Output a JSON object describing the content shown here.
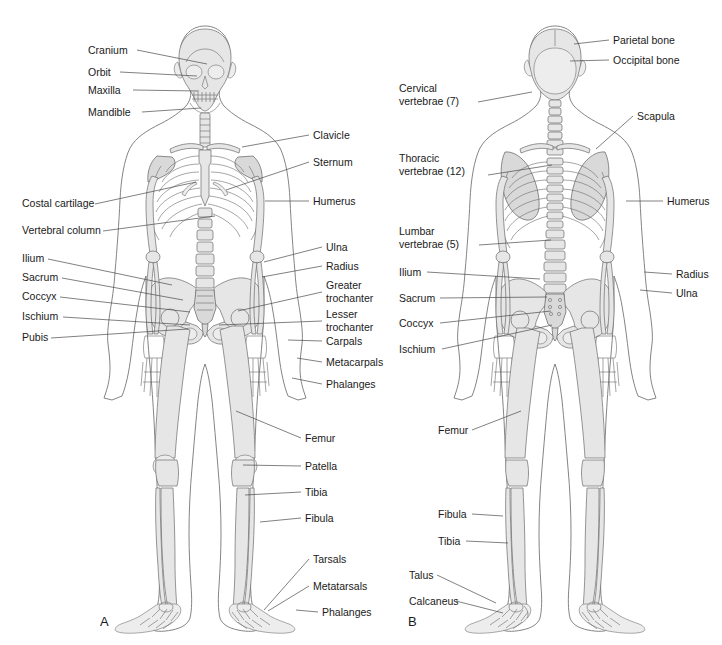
{
  "figure": {
    "background_color": "#ffffff",
    "bone_fill_color": "#e6e6e6",
    "bone_outline_color": "#6a6a6a",
    "body_outline_color": "#6e6e6e",
    "leader_line_color": "#4a4a4a",
    "text_color": "#1a1a1a"
  },
  "panels": [
    {
      "id": "panel-a",
      "letter": "A",
      "view": "anterior",
      "letter_position": {
        "x": 100,
        "y": 626
      }
    },
    {
      "id": "panel-b",
      "letter": "B",
      "view": "posterior",
      "letter_position": {
        "x": 408,
        "y": 626
      }
    }
  ],
  "panel_a_labels": [
    {
      "id": "cranium",
      "text": "Cranium",
      "lines": [
        "Cranium"
      ],
      "side": "left",
      "text_x": 88,
      "text_y": 54,
      "anchor": "start",
      "leader": [
        [
          137,
          50
        ],
        [
          207,
          64
        ]
      ]
    },
    {
      "id": "orbit",
      "text": "Orbit",
      "lines": [
        "Orbit"
      ],
      "side": "left",
      "text_x": 88,
      "text_y": 76,
      "anchor": "start",
      "leader": [
        [
          120,
          72
        ],
        [
          197,
          76
        ]
      ]
    },
    {
      "id": "maxilla",
      "text": "Maxilla",
      "lines": [
        "Maxilla"
      ],
      "side": "left",
      "text_x": 88,
      "text_y": 94,
      "anchor": "start",
      "leader": [
        [
          133,
          90
        ],
        [
          199,
          91
        ]
      ]
    },
    {
      "id": "mandible",
      "text": "Mandible",
      "lines": [
        "Mandible"
      ],
      "side": "left",
      "text_x": 88,
      "text_y": 116,
      "anchor": "start",
      "leader": [
        [
          142,
          112
        ],
        [
          201,
          108
        ]
      ]
    },
    {
      "id": "costal-cartilage",
      "text": "Costal cartilage",
      "lines": [
        "Costal cartilage"
      ],
      "side": "left",
      "text_x": 22,
      "text_y": 207,
      "anchor": "start",
      "leader": [
        [
          95,
          204
        ],
        [
          196,
          182
        ]
      ]
    },
    {
      "id": "vertebral-column",
      "text": "Vertebral column",
      "lines": [
        "Vertebral column"
      ],
      "side": "left",
      "text_x": 22,
      "text_y": 234,
      "anchor": "start",
      "leader": [
        [
          103,
          231
        ],
        [
          215,
          216
        ]
      ]
    },
    {
      "id": "ilium",
      "text": "Ilium",
      "lines": [
        "Ilium"
      ],
      "side": "left",
      "text_x": 22,
      "text_y": 262,
      "anchor": "start",
      "leader": [
        [
          48,
          259
        ],
        [
          172,
          285
        ]
      ]
    },
    {
      "id": "sacrum",
      "text": "Sacrum",
      "lines": [
        "Sacrum"
      ],
      "side": "left",
      "text_x": 22,
      "text_y": 281,
      "anchor": "start",
      "leader": [
        [
          62,
          278
        ],
        [
          183,
          300
        ]
      ]
    },
    {
      "id": "coccyx",
      "text": "Coccyx",
      "lines": [
        "Coccyx"
      ],
      "side": "left",
      "text_x": 22,
      "text_y": 300,
      "anchor": "start",
      "leader": [
        [
          60,
          297
        ],
        [
          190,
          312
        ]
      ]
    },
    {
      "id": "ischium",
      "text": "Ischium",
      "lines": [
        "Ischium"
      ],
      "side": "left",
      "text_x": 22,
      "text_y": 320,
      "anchor": "start",
      "leader": [
        [
          63,
          317
        ],
        [
          190,
          325
        ]
      ]
    },
    {
      "id": "pubis",
      "text": "Pubis",
      "lines": [
        "Pubis"
      ],
      "side": "left",
      "text_x": 22,
      "text_y": 341,
      "anchor": "start",
      "leader": [
        [
          51,
          338
        ],
        [
          188,
          329
        ]
      ]
    },
    {
      "id": "clavicle",
      "text": "Clavicle",
      "lines": [
        "Clavicle"
      ],
      "side": "right",
      "text_x": 313,
      "text_y": 139,
      "anchor": "start",
      "leader": [
        [
          309,
          135
        ],
        [
          242,
          147
        ]
      ]
    },
    {
      "id": "sternum",
      "text": "Sternum",
      "lines": [
        "Sternum"
      ],
      "side": "right",
      "text_x": 313,
      "text_y": 166,
      "anchor": "start",
      "leader": [
        [
          309,
          162
        ],
        [
          226,
          190
        ]
      ]
    },
    {
      "id": "humerus",
      "text": "Humerus",
      "lines": [
        "Humerus"
      ],
      "side": "right",
      "text_x": 313,
      "text_y": 205,
      "anchor": "start",
      "leader": [
        [
          309,
          201
        ],
        [
          265,
          201
        ]
      ]
    },
    {
      "id": "ulna",
      "text": "Ulna",
      "lines": [
        "Ulna"
      ],
      "side": "right",
      "text_x": 326,
      "text_y": 251,
      "anchor": "start",
      "leader": [
        [
          322,
          247
        ],
        [
          264,
          262
        ]
      ]
    },
    {
      "id": "radius",
      "text": "Radius",
      "lines": [
        "Radius"
      ],
      "side": "right",
      "text_x": 326,
      "text_y": 270,
      "anchor": "start",
      "leader": [
        [
          322,
          266
        ],
        [
          262,
          277
        ]
      ]
    },
    {
      "id": "greater-trochanter",
      "text": "Greater trochanter",
      "lines": [
        "Greater",
        "trochanter"
      ],
      "side": "right",
      "text_x": 326,
      "text_y": 289,
      "anchor": "start",
      "leader": [
        [
          322,
          292
        ],
        [
          238,
          311
        ]
      ]
    },
    {
      "id": "lesser-trochanter",
      "text": "Lesser trochanter",
      "lines": [
        "Lesser",
        "trochanter"
      ],
      "side": "right",
      "text_x": 326,
      "text_y": 318,
      "anchor": "start",
      "leader": [
        [
          322,
          321
        ],
        [
          219,
          325
        ]
      ]
    },
    {
      "id": "carpals",
      "text": "Carpals",
      "lines": [
        "Carpals"
      ],
      "side": "right",
      "text_x": 326,
      "text_y": 345,
      "anchor": "start",
      "leader": [
        [
          322,
          341
        ],
        [
          288,
          340
        ]
      ]
    },
    {
      "id": "metacarpals",
      "text": "Metacarpals",
      "lines": [
        "Metacarpals"
      ],
      "side": "right",
      "text_x": 326,
      "text_y": 366,
      "anchor": "start",
      "leader": [
        [
          322,
          362
        ],
        [
          297,
          358
        ]
      ]
    },
    {
      "id": "phalanges-hand",
      "text": "Phalanges",
      "lines": [
        "Phalanges"
      ],
      "side": "right",
      "text_x": 326,
      "text_y": 388,
      "anchor": "start",
      "leader": [
        [
          322,
          384
        ],
        [
          292,
          378
        ]
      ]
    },
    {
      "id": "femur",
      "text": "Femur",
      "lines": [
        "Femur"
      ],
      "side": "right",
      "text_x": 305,
      "text_y": 442,
      "anchor": "start",
      "leader": [
        [
          301,
          438
        ],
        [
          236,
          411
        ]
      ]
    },
    {
      "id": "patella",
      "text": "Patella",
      "lines": [
        "Patella"
      ],
      "side": "right",
      "text_x": 305,
      "text_y": 470,
      "anchor": "start",
      "leader": [
        [
          301,
          466
        ],
        [
          243,
          465
        ]
      ]
    },
    {
      "id": "tibia",
      "text": "Tibia",
      "lines": [
        "Tibia"
      ],
      "side": "right",
      "text_x": 305,
      "text_y": 496,
      "anchor": "start",
      "leader": [
        [
          301,
          492
        ],
        [
          245,
          495
        ]
      ]
    },
    {
      "id": "fibula",
      "text": "Fibula",
      "lines": [
        "Fibula"
      ],
      "side": "right",
      "text_x": 305,
      "text_y": 522,
      "anchor": "start",
      "leader": [
        [
          301,
          518
        ],
        [
          260,
          522
        ]
      ]
    },
    {
      "id": "tarsals",
      "text": "Tarsals",
      "lines": [
        "Tarsals"
      ],
      "side": "right",
      "text_x": 313,
      "text_y": 563,
      "anchor": "start",
      "leader": [
        [
          309,
          559
        ],
        [
          264,
          610
        ]
      ]
    },
    {
      "id": "metatarsals",
      "text": "Metatarsals",
      "lines": [
        "Metatarsals"
      ],
      "side": "right",
      "text_x": 313,
      "text_y": 590,
      "anchor": "start",
      "leader": [
        [
          309,
          586
        ],
        [
          268,
          611
        ]
      ]
    },
    {
      "id": "phalanges-foot",
      "text": "Phalanges",
      "lines": [
        "Phalanges"
      ],
      "side": "right",
      "text_x": 322,
      "text_y": 616,
      "anchor": "start",
      "leader": [
        [
          318,
          612
        ],
        [
          296,
          610
        ]
      ]
    }
  ],
  "panel_b_labels": [
    {
      "id": "cervical-vertebrae",
      "text": "Cervical vertebrae (7)",
      "lines": [
        "Cervical",
        "vertebrae (7)"
      ],
      "side": "left",
      "text_x": 399,
      "text_y": 92,
      "anchor": "start",
      "leader": [
        [
          478,
          102
        ],
        [
          532,
          92
        ]
      ]
    },
    {
      "id": "thoracic-vertebrae",
      "text": "Thoracic vertebrae (12)",
      "lines": [
        "Thoracic",
        "vertebrae (12)"
      ],
      "side": "left",
      "text_x": 399,
      "text_y": 162,
      "anchor": "start",
      "leader": [
        [
          488,
          175
        ],
        [
          552,
          165
        ]
      ]
    },
    {
      "id": "lumbar-vertebrae",
      "text": "Lumbar vertebrae (5)",
      "lines": [
        "Lumbar",
        "vertebrae (5)"
      ],
      "side": "left",
      "text_x": 399,
      "text_y": 235,
      "anchor": "start",
      "leader": [
        [
          479,
          245
        ],
        [
          551,
          240
        ]
      ]
    },
    {
      "id": "ilium-b",
      "text": "Ilium",
      "lines": [
        "Ilium"
      ],
      "side": "left",
      "text_x": 399,
      "text_y": 276,
      "anchor": "start",
      "leader": [
        [
          427,
          272
        ],
        [
          540,
          279
        ]
      ]
    },
    {
      "id": "sacrum-b",
      "text": "Sacrum",
      "lines": [
        "Sacrum"
      ],
      "side": "left",
      "text_x": 399,
      "text_y": 302,
      "anchor": "start",
      "leader": [
        [
          440,
          298
        ],
        [
          547,
          297
        ]
      ]
    },
    {
      "id": "coccyx-b",
      "text": "Coccyx",
      "lines": [
        "Coccyx"
      ],
      "side": "left",
      "text_x": 399,
      "text_y": 327,
      "anchor": "start",
      "leader": [
        [
          440,
          323
        ],
        [
          551,
          311
        ]
      ]
    },
    {
      "id": "ischium-b",
      "text": "Ischium",
      "lines": [
        "Ischium"
      ],
      "side": "left",
      "text_x": 399,
      "text_y": 353,
      "anchor": "start",
      "leader": [
        [
          442,
          349
        ],
        [
          552,
          325
        ]
      ]
    },
    {
      "id": "femur-b",
      "text": "Femur",
      "lines": [
        "Femur"
      ],
      "side": "left",
      "text_x": 438,
      "text_y": 434,
      "anchor": "start",
      "leader": [
        [
          472,
          430
        ],
        [
          521,
          411
        ]
      ]
    },
    {
      "id": "fibula-b",
      "text": "Fibula",
      "lines": [
        "Fibula"
      ],
      "side": "left",
      "text_x": 438,
      "text_y": 518,
      "anchor": "start",
      "leader": [
        [
          472,
          514
        ],
        [
          503,
          516
        ]
      ]
    },
    {
      "id": "tibia-b",
      "text": "Tibia",
      "lines": [
        "Tibia"
      ],
      "side": "left",
      "text_x": 438,
      "text_y": 545,
      "anchor": "start",
      "leader": [
        [
          466,
          541
        ],
        [
          508,
          543
        ]
      ]
    },
    {
      "id": "talus",
      "text": "Talus",
      "lines": [
        "Talus"
      ],
      "side": "left",
      "text_x": 409,
      "text_y": 579,
      "anchor": "start",
      "leader": [
        [
          437,
          575
        ],
        [
          496,
          603
        ]
      ]
    },
    {
      "id": "calcaneus",
      "text": "Calcaneus",
      "lines": [
        "Calcaneus"
      ],
      "side": "left",
      "text_x": 409,
      "text_y": 605,
      "anchor": "start",
      "leader": [
        [
          456,
          601
        ],
        [
          503,
          613
        ]
      ]
    },
    {
      "id": "parietal-bone",
      "text": "Parietal bone",
      "lines": [
        "Parietal bone"
      ],
      "side": "right",
      "text_x": 613,
      "text_y": 44,
      "anchor": "start",
      "leader": [
        [
          609,
          40
        ],
        [
          574,
          44
        ]
      ]
    },
    {
      "id": "occipital-bone",
      "text": "Occipital bone",
      "lines": [
        "Occipital bone"
      ],
      "side": "right",
      "text_x": 613,
      "text_y": 64,
      "anchor": "start",
      "leader": [
        [
          609,
          60
        ],
        [
          570,
          61
        ]
      ]
    },
    {
      "id": "scapula",
      "text": "Scapula",
      "lines": [
        "Scapula"
      ],
      "side": "right",
      "text_x": 637,
      "text_y": 120,
      "anchor": "start",
      "leader": [
        [
          633,
          116
        ],
        [
          596,
          149
        ]
      ]
    },
    {
      "id": "humerus-b",
      "text": "Humerus",
      "lines": [
        "Humerus"
      ],
      "side": "right",
      "text_x": 667,
      "text_y": 205,
      "anchor": "start",
      "leader": [
        [
          663,
          201
        ],
        [
          626,
          201
        ]
      ]
    },
    {
      "id": "radius-b",
      "text": "Radius",
      "lines": [
        "Radius"
      ],
      "side": "right",
      "text_x": 676,
      "text_y": 278,
      "anchor": "start",
      "leader": [
        [
          672,
          274
        ],
        [
          644,
          272
        ]
      ]
    },
    {
      "id": "ulna-b",
      "text": "Ulna",
      "lines": [
        "Ulna"
      ],
      "side": "right",
      "text_x": 676,
      "text_y": 297,
      "anchor": "start",
      "leader": [
        [
          672,
          293
        ],
        [
          640,
          290
        ]
      ]
    }
  ]
}
